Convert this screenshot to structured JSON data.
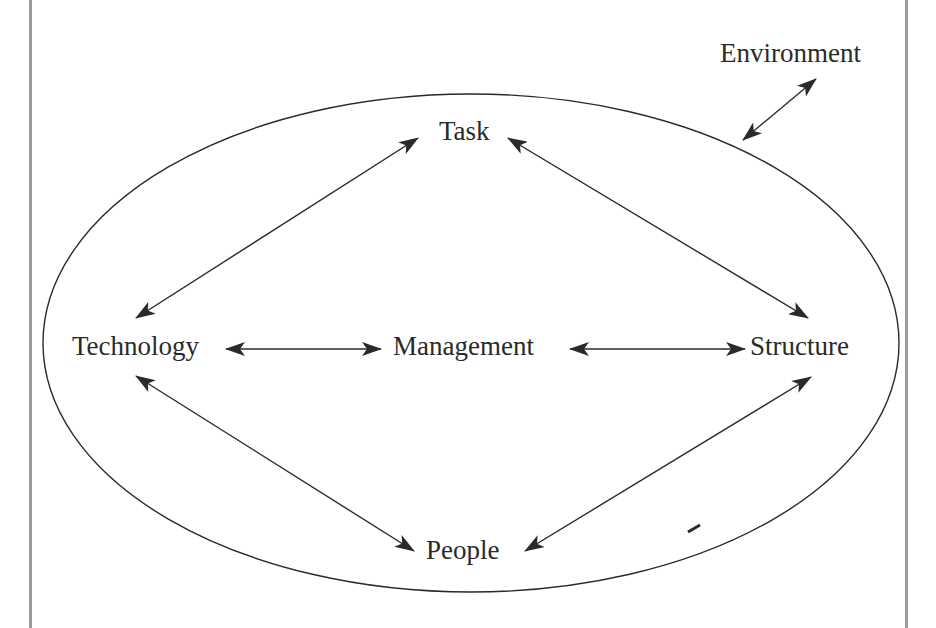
{
  "diagram": {
    "title": "",
    "colors": {
      "line": "#2a2a2a",
      "text": "#2a2a2a",
      "border": "#9a9a9a",
      "background": "#ffffff"
    },
    "boundary": {
      "shape": "ellipse",
      "label": "Environment"
    },
    "nodes": [
      {
        "id": "task",
        "label": "Task"
      },
      {
        "id": "technology",
        "label": "Technology"
      },
      {
        "id": "management",
        "label": "Management"
      },
      {
        "id": "structure",
        "label": "Structure"
      },
      {
        "id": "people",
        "label": "People"
      },
      {
        "id": "environment",
        "label": "Environment"
      }
    ],
    "edges": [
      {
        "from": "task",
        "to": "technology",
        "type": "bidirectional"
      },
      {
        "from": "task",
        "to": "structure",
        "type": "bidirectional"
      },
      {
        "from": "technology",
        "to": "management",
        "type": "bidirectional"
      },
      {
        "from": "management",
        "to": "structure",
        "type": "bidirectional"
      },
      {
        "from": "technology",
        "to": "people",
        "type": "bidirectional"
      },
      {
        "from": "structure",
        "to": "people",
        "type": "bidirectional"
      },
      {
        "from": "environment",
        "to": "boundary",
        "type": "bidirectional"
      }
    ]
  }
}
